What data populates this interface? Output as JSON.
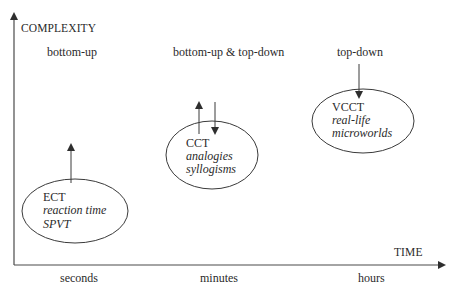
{
  "axes": {
    "y_label": "COMPLEXITY",
    "x_label": "TIME",
    "x_ticks": [
      "seconds",
      "minutes",
      "hours"
    ]
  },
  "processing_labels": {
    "left": "bottom-up",
    "middle": "bottom-up & top-down",
    "right": "top-down"
  },
  "nodes": [
    {
      "title": "ECT",
      "items": [
        "reaction time",
        "SPVT"
      ]
    },
    {
      "title": "CCT",
      "items": [
        "analogies",
        "syllogisms"
      ]
    },
    {
      "title": "VCCT",
      "items": [
        "real-life",
        "microworlds"
      ]
    }
  ],
  "colors": {
    "stroke": "#3a3a3a",
    "text": "#2a2a2a",
    "background": "#ffffff"
  }
}
